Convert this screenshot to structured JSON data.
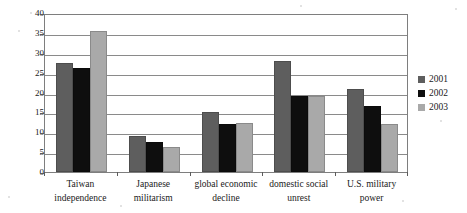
{
  "chart_data": {
    "type": "bar",
    "title": "",
    "xlabel": "",
    "ylabel": "percentage",
    "ylim": [
      0,
      40
    ],
    "ytick_step": 5,
    "yticks": [
      "40",
      "35",
      "30",
      "25",
      "20",
      "15",
      "10",
      "5",
      "0"
    ],
    "grid": true,
    "legend_position": "right",
    "categories": [
      "Taiwan independence",
      "Japanese militarism",
      "global economic decline",
      "domestic social unrest",
      "U.S. military power"
    ],
    "category_lines": [
      [
        "Taiwan",
        "independence"
      ],
      [
        "Japanese",
        "militarism"
      ],
      [
        "global economic",
        "decline"
      ],
      [
        "domestic social",
        "unrest"
      ],
      [
        "U.S. military",
        "power"
      ]
    ],
    "series": [
      {
        "name": "2001",
        "color": "#5e5e5e",
        "values": [
          27.4,
          9.0,
          15.0,
          28.0,
          21.0
        ]
      },
      {
        "name": "2002",
        "color": "#0e0e0e",
        "values": [
          26.2,
          7.6,
          12.2,
          19.2,
          16.6
        ]
      },
      {
        "name": "2003",
        "color": "#a9a9a9",
        "values": [
          35.5,
          6.2,
          12.4,
          19.2,
          12.0
        ]
      }
    ]
  },
  "legend": {
    "items": [
      {
        "label": "2001",
        "color": "#5e5e5e"
      },
      {
        "label": "2002",
        "color": "#0e0e0e"
      },
      {
        "label": "2003",
        "color": "#a9a9a9"
      }
    ]
  },
  "colors": {
    "series_2001": "#5e5e5e",
    "series_2002": "#0e0e0e",
    "series_2003": "#a9a9a9",
    "frame": "#7e7e7e",
    "gridline": "#8a8a8a",
    "background": "#ffffff",
    "text": "#1a1a1a"
  }
}
